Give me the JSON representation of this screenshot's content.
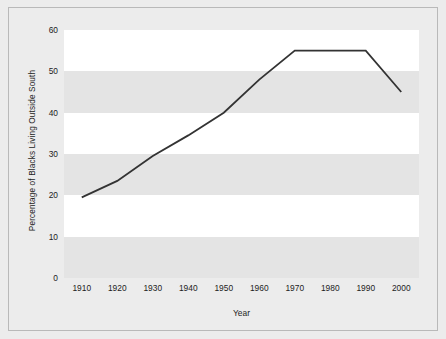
{
  "chart_data": {
    "type": "line",
    "title": "",
    "xlabel": "Year",
    "ylabel": "Percentage of Blacks Living Outside South",
    "x": [
      1910,
      1920,
      1930,
      1940,
      1950,
      1960,
      1970,
      1980,
      1990,
      2000
    ],
    "values": [
      19.5,
      23.5,
      29.5,
      34.5,
      40,
      48,
      55,
      55,
      55,
      45
    ],
    "xticklabels": [
      "1910",
      "1920",
      "1930",
      "1940",
      "1950",
      "1960",
      "1970",
      "1980",
      "1990",
      "2000"
    ],
    "yticklabels": [
      "0",
      "10",
      "20",
      "30",
      "40",
      "50",
      "60"
    ],
    "yticks": [
      0,
      10,
      20,
      30,
      40,
      50,
      60
    ],
    "xlim": [
      1905,
      2005
    ],
    "ylim": [
      0,
      60
    ],
    "grid": false,
    "banded_background": true,
    "legend": null,
    "line_color": "#333333",
    "band_white": "#ffffff",
    "band_gray": "#e4e4e4",
    "figure_background": "#ececec"
  }
}
